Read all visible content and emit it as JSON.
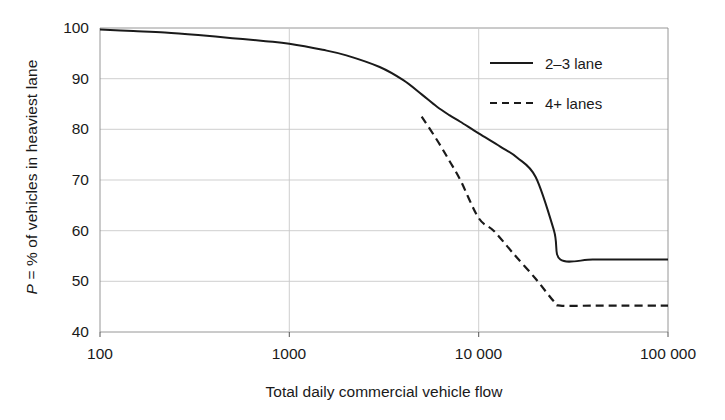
{
  "chart_data": {
    "type": "line",
    "title": "",
    "xlabel": "Total daily commercial vehicle flow",
    "ylabel": "P = % of vehicles in heaviest lane",
    "ylabel_italic_part": "P",
    "ylabel_rest": " = % of vehicles in heaviest lane",
    "xscale": "log",
    "xlim": [
      100,
      100000
    ],
    "ylim": [
      40,
      100
    ],
    "grid": true,
    "legend_position": "upper right",
    "xticks": [
      100,
      1000,
      10000,
      100000
    ],
    "xticklabels": [
      "100",
      "1000",
      "10 000",
      "100 000"
    ],
    "yticks": [
      40,
      50,
      60,
      70,
      80,
      90,
      100
    ],
    "yticklabels": [
      "40",
      "50",
      "60",
      "70",
      "80",
      "90",
      "100"
    ],
    "series": [
      {
        "name": "2–3 lane",
        "style": "solid",
        "color": "#1a1a1a",
        "x": [
          100,
          150,
          220,
          330,
          500,
          750,
          1000,
          1500,
          2000,
          3000,
          4000,
          5000,
          6000,
          7000,
          8000,
          10000,
          13000,
          16000,
          20000,
          25000,
          27000,
          40000,
          60000,
          100000
        ],
        "y": [
          99.7,
          99.4,
          99.1,
          98.6,
          98.0,
          97.4,
          96.9,
          95.7,
          94.6,
          92.3,
          89.7,
          86.9,
          84.5,
          82.8,
          81.5,
          79.2,
          76.6,
          74.4,
          70.6,
          60.0,
          54.3,
          54.3,
          54.3,
          54.3
        ]
      },
      {
        "name": "4+ lanes",
        "style": "dashed",
        "color": "#1a1a1a",
        "x": [
          5000,
          6000,
          7000,
          8000,
          10000,
          12000,
          15000,
          20000,
          25000,
          27000,
          40000,
          60000,
          100000
        ],
        "y": [
          82.5,
          78.0,
          73.8,
          70.0,
          62.5,
          60.0,
          55.8,
          50.5,
          46.0,
          45.2,
          45.2,
          45.2,
          45.2
        ]
      }
    ],
    "legend_entries": [
      {
        "label": "2–3 lane",
        "style": "solid"
      },
      {
        "label": "4+ lanes",
        "style": "dashed"
      }
    ]
  }
}
